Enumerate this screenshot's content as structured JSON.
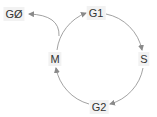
{
  "diagram": {
    "nodes": [
      {
        "id": "G0",
        "label": "GØ",
        "x": 14,
        "y": 14
      },
      {
        "id": "G1",
        "label": "G1",
        "x": 96,
        "y": 13
      },
      {
        "id": "S",
        "label": "S",
        "x": 144,
        "y": 59
      },
      {
        "id": "G2",
        "label": "G2",
        "x": 99,
        "y": 107
      },
      {
        "id": "M",
        "label": "M",
        "x": 55,
        "y": 59
      }
    ],
    "edges": [
      {
        "from": "G1",
        "to": "S"
      },
      {
        "from": "S",
        "to": "G2"
      },
      {
        "from": "G2",
        "to": "M"
      },
      {
        "from": "M",
        "to": "G1"
      },
      {
        "from": "M",
        "to": "G0"
      }
    ],
    "colors": {
      "edge": "#8a8a8a",
      "label_bg": "#f2f2f2",
      "label_text": "#333333"
    }
  }
}
